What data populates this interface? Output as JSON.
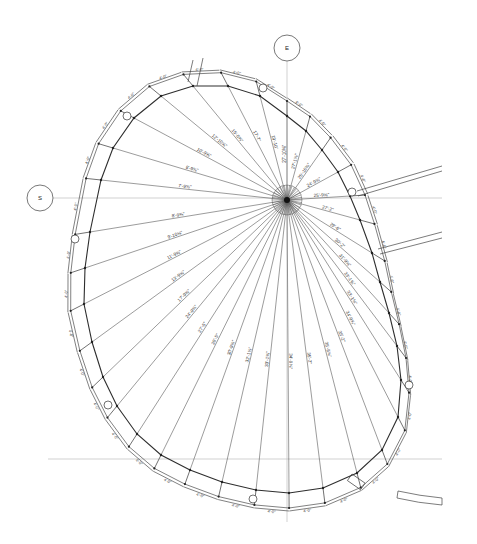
{
  "drawing": {
    "type": "architectural radial dimension plan",
    "background": "#ffffff",
    "line_color": "#333333",
    "center": [
      287,
      200
    ],
    "grid_bubbles": [
      {
        "label": "E",
        "cx": 287,
        "cy": 48,
        "r": 13
      },
      {
        "label": "S",
        "cx": 40,
        "cy": 198,
        "r": 13
      }
    ],
    "grid_lines": [
      {
        "x1": 287,
        "y1": 61,
        "x2": 287,
        "y2": 522
      },
      {
        "x1": 53,
        "y1": 198,
        "x2": 442,
        "y2": 198
      },
      {
        "x1": 48,
        "y1": 459,
        "x2": 442,
        "y2": 459
      }
    ],
    "wall_vertices": [
      [
        287,
        116
      ],
      [
        306,
        131
      ],
      [
        322,
        150
      ],
      [
        338,
        172
      ],
      [
        350,
        196
      ],
      [
        360,
        220
      ],
      [
        372,
        253
      ],
      [
        380,
        282
      ],
      [
        389,
        313
      ],
      [
        397,
        346
      ],
      [
        401,
        380
      ],
      [
        398,
        417
      ],
      [
        382,
        450
      ],
      [
        357,
        473
      ],
      [
        323,
        488
      ],
      [
        289,
        493
      ],
      [
        256,
        490
      ],
      [
        222,
        482
      ],
      [
        190,
        470
      ],
      [
        161,
        455
      ],
      [
        137,
        434
      ],
      [
        117,
        406
      ],
      [
        103,
        377
      ],
      [
        92,
        342
      ],
      [
        84,
        304
      ],
      [
        85,
        268
      ],
      [
        90,
        232
      ],
      [
        101,
        180
      ],
      [
        113,
        148
      ],
      [
        134,
        118
      ],
      [
        161,
        96
      ],
      [
        193,
        86
      ],
      [
        228,
        86
      ],
      [
        260,
        96
      ]
    ],
    "wall_thickness": 15,
    "radial_dimensions": [
      {
        "label": "27'-10⅜\"",
        "at": 0.55
      },
      {
        "label": "27'-1⅝\"",
        "at": 0.55
      },
      {
        "label": "25'-10⅜\"",
        "at": 0.55
      },
      {
        "label": "24'-9⅝\"",
        "at": 0.55
      },
      {
        "label": "25'-9⅝\"",
        "at": 0.55
      },
      {
        "label": "27'-2\"",
        "at": 0.55
      },
      {
        "label": "29'-6\"",
        "at": 0.55
      },
      {
        "label": "30'-2\"",
        "at": 0.55
      },
      {
        "label": "31'-9⅝\"",
        "at": 0.55
      },
      {
        "label": "33'-1⅜\"",
        "at": 0.55
      },
      {
        "label": "33'-1⅜\"",
        "at": 0.55
      },
      {
        "label": "34'-9⅝\"",
        "at": 0.55
      },
      {
        "label": "35'-2\"",
        "at": 0.55
      },
      {
        "label": "35'-9⅝\"",
        "at": 0.55
      },
      {
        "label": "35'-2\"",
        "at": 0.55
      },
      {
        "label": "34'-9⅝\"",
        "at": 0.55
      },
      {
        "label": "33'-1⅜\"",
        "at": 0.55
      },
      {
        "label": "32'-1⅝\"",
        "at": 0.55
      },
      {
        "label": "30'-9⅝\"",
        "at": 0.55
      },
      {
        "label": "28'-5\"",
        "at": 0.55
      },
      {
        "label": "27'-5\"",
        "at": 0.55
      },
      {
        "label": "24'-9⅝\"",
        "at": 0.55
      },
      {
        "label": "17'-9⅝\"",
        "at": 0.55
      },
      {
        "label": "13'-9⅝\"",
        "at": 0.55
      },
      {
        "label": "11'-9⅝\"",
        "at": 0.55
      },
      {
        "label": "9'-10⅝\"",
        "at": 0.55
      },
      {
        "label": "8'-9⅝\"",
        "at": 0.55
      },
      {
        "label": "7'-9⅝\"",
        "at": 0.55
      },
      {
        "label": "8'-9⅝\"",
        "at": 0.55
      },
      {
        "label": "10'-9⅝\"",
        "at": 0.55
      },
      {
        "label": "12'-10⅝\"",
        "at": 0.55
      },
      {
        "label": "15'-0⅝\"",
        "at": 0.55
      },
      {
        "label": "17'-7\"",
        "at": 0.55
      },
      {
        "label": "19'-10\"",
        "at": 0.55
      }
    ],
    "segment_label": "4'-0\"",
    "columns": [
      {
        "cx": 263,
        "cy": 88,
        "r": 4
      },
      {
        "cx": 127,
        "cy": 116,
        "r": 4
      },
      {
        "cx": 75,
        "cy": 239,
        "r": 4
      },
      {
        "cx": 108,
        "cy": 405,
        "r": 4
      },
      {
        "cx": 253,
        "cy": 499,
        "r": 4
      },
      {
        "cx": 409,
        "cy": 385,
        "r": 4
      },
      {
        "cx": 352,
        "cy": 192,
        "r": 4
      }
    ],
    "beams": [
      {
        "points": [
          [
            357,
            191
          ],
          [
            442,
            166
          ]
        ]
      },
      {
        "points": [
          [
            358,
            196
          ],
          [
            442,
            171
          ]
        ]
      },
      {
        "points": [
          [
            378,
            249
          ],
          [
            442,
            232
          ]
        ]
      },
      {
        "points": [
          [
            380,
            254
          ],
          [
            442,
            238
          ]
        ]
      },
      {
        "points": [
          [
            193,
            60
          ],
          [
            188,
            82
          ]
        ]
      },
      {
        "points": [
          [
            203,
            58
          ],
          [
            197,
            86
          ]
        ]
      }
    ],
    "stub_rect": {
      "x": 352,
      "y": 474,
      "w": 16,
      "h": 8,
      "rotate": 35
    },
    "arc_fragment": {
      "d": "M398,491 Q420,496 442,498 L442,505 Q418,503 397,498 Z"
    }
  }
}
